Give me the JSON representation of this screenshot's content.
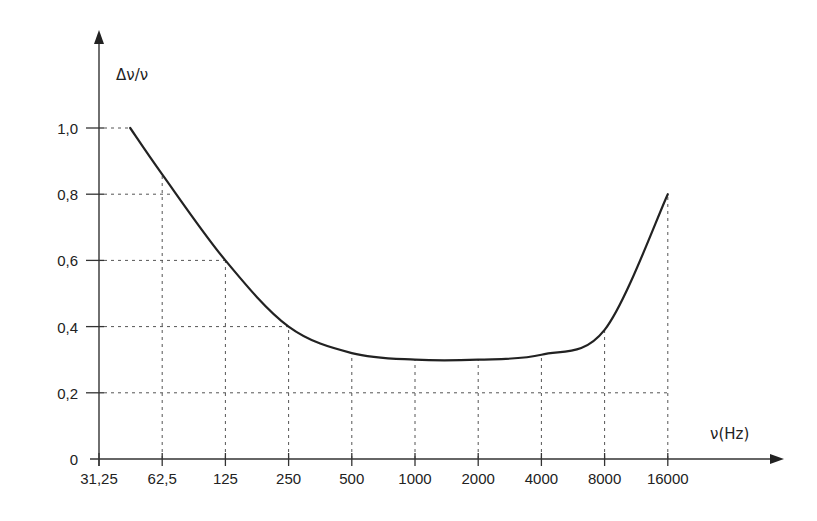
{
  "chart_data": {
    "type": "line",
    "title": "",
    "xlabel": "ν(Hz)",
    "ylabel": "Δν/ν",
    "x_scale": "log2 (octave bands)",
    "x_ticks": [
      "31,25",
      "62,5",
      "125",
      "250",
      "500",
      "1000",
      "2000",
      "4000",
      "8000",
      "16000"
    ],
    "y_ticks": [
      "0",
      "0,2",
      "0,4",
      "0,6",
      "0,8",
      "1,0"
    ],
    "ylim": [
      0,
      1.0
    ],
    "grid": "dashed reference lines from axes to curve",
    "series": [
      {
        "name": "Δν/ν",
        "x": [
          44,
          62.5,
          125,
          250,
          500,
          1000,
          2000,
          4000,
          8000,
          16000
        ],
        "values": [
          1.0,
          0.86,
          0.6,
          0.4,
          0.32,
          0.3,
          0.3,
          0.315,
          0.39,
          0.8
        ]
      }
    ]
  },
  "labels": {
    "y_axis": "Δν/ν",
    "x_axis": "ν(Hz)"
  },
  "colors": {
    "axis": "#333333",
    "curve": "#222222",
    "grid": "#555555"
  }
}
